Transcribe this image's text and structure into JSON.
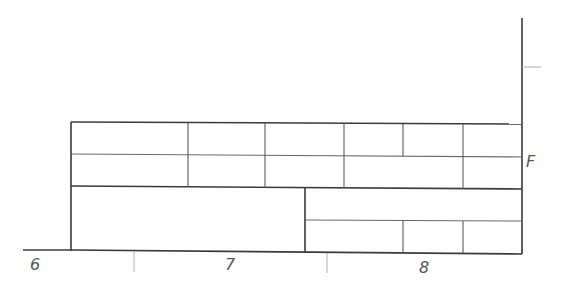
{
  "diagram": {
    "type": "elevation-grid",
    "colors": {
      "background": "#ffffff",
      "heavy_line": "#3a3a3a",
      "light_line": "#6a6a6a",
      "tick_line": "#b0b0b0",
      "label": "#555555"
    },
    "axis_labels": {
      "bottom": [
        "6",
        "7",
        "8"
      ],
      "right": "F"
    },
    "structure": {
      "upper_band": {
        "rows": 2,
        "top_row_divisions": 6,
        "bottom_row_divisions": 5
      },
      "lower_band": {
        "left_panel": "single large panel",
        "right_panel": {
          "rows": 2,
          "top_row_divisions": 1,
          "bottom_row_divisions": 3
        }
      }
    }
  }
}
